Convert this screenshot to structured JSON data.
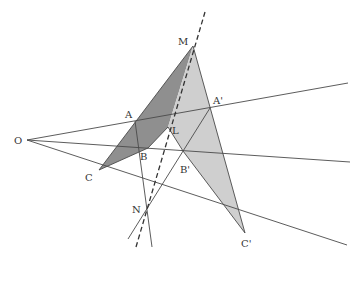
{
  "diagram": {
    "type": "projective-geometry-desargues",
    "colors": {
      "dark_fill": "#8f8f8f",
      "light_fill": "#cfcfcf",
      "line": "#4a4a4a",
      "label": "#333333"
    },
    "points": {
      "O": {
        "label": "O",
        "x": 27,
        "y": 140
      },
      "A": {
        "label": "A",
        "x": 135,
        "y": 121
      },
      "B": {
        "label": "B",
        "x": 148,
        "y": 148
      },
      "C": {
        "label": "C",
        "x": 99,
        "y": 170
      },
      "A_prime": {
        "label": "A'",
        "x": 210,
        "y": 108
      },
      "B_prime": {
        "label": "B'",
        "x": 183,
        "y": 151
      },
      "C_prime": {
        "label": "C'",
        "x": 245,
        "y": 233
      },
      "M": {
        "label": "M",
        "x": 193,
        "y": 46
      },
      "L": {
        "label": "L",
        "x": 168,
        "y": 127
      },
      "N": {
        "label": "N",
        "x": 146,
        "y": 210
      }
    },
    "labels": [
      {
        "id": "O",
        "text": "O",
        "x": 14,
        "y": 144
      },
      {
        "id": "A",
        "text": "A",
        "x": 125,
        "y": 118
      },
      {
        "id": "B",
        "text": "B",
        "x": 140,
        "y": 160
      },
      {
        "id": "C",
        "text": "C",
        "x": 85,
        "y": 181
      },
      {
        "id": "A_prime",
        "text": "A'",
        "x": 213,
        "y": 104
      },
      {
        "id": "B_prime",
        "text": "B'",
        "x": 180,
        "y": 173
      },
      {
        "id": "C_prime",
        "text": "C'",
        "x": 241,
        "y": 247
      },
      {
        "id": "M",
        "text": "M",
        "x": 178,
        "y": 45
      },
      {
        "id": "L",
        "text": "L",
        "x": 172,
        "y": 134
      },
      {
        "id": "N",
        "text": "N",
        "x": 132,
        "y": 213
      }
    ],
    "shaded_regions": [
      {
        "name": "dark-triangle-planes",
        "fill": "#8f8f8f",
        "points": "99,170 193,46 168,127 148,148"
      },
      {
        "name": "light-triangle-planes",
        "fill": "#cfcfcf",
        "points": "193,46 245,233 183,151 168,127"
      }
    ],
    "lines": [
      {
        "name": "ray-OA",
        "x1": 27,
        "y1": 140,
        "x2": 348,
        "y2": 83
      },
      {
        "name": "ray-OB",
        "x1": 27,
        "y1": 140,
        "x2": 350,
        "y2": 162
      },
      {
        "name": "ray-OC",
        "x1": 27,
        "y1": 140,
        "x2": 347,
        "y2": 245
      },
      {
        "name": "line-AB-N",
        "x1": 135,
        "y1": 121,
        "x2": 152,
        "y2": 247
      },
      {
        "name": "line-A'B'-N",
        "x1": 210,
        "y1": 108,
        "x2": 128,
        "y2": 239
      },
      {
        "name": "line-CM",
        "x1": 99,
        "y1": 170,
        "x2": 193,
        "y2": 46
      },
      {
        "name": "line-MC'",
        "x1": 193,
        "y1": 46,
        "x2": 245,
        "y2": 233
      },
      {
        "name": "line-BL",
        "x1": 148,
        "y1": 148,
        "x2": 168,
        "y2": 127
      },
      {
        "name": "line-LB'",
        "x1": 168,
        "y1": 127,
        "x2": 183,
        "y2": 151
      },
      {
        "name": "line-B'C'",
        "x1": 183,
        "y1": 151,
        "x2": 245,
        "y2": 233
      },
      {
        "name": "line-CB",
        "x1": 99,
        "y1": 170,
        "x2": 148,
        "y2": 148
      }
    ],
    "dashed_line": {
      "name": "axis-MLN",
      "x1": 136,
      "y1": 247,
      "x2": 205,
      "y2": 12
    }
  }
}
